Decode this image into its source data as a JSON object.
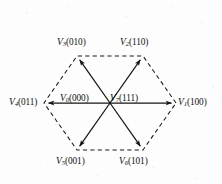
{
  "figure": {
    "shape": "hexagon",
    "edge_style": "dashed",
    "line_color": "#1a1a1a",
    "background_color": "#fdfdfd",
    "center": {
      "x": 110,
      "y": 103
    }
  },
  "vectors": [
    {
      "id": "V1",
      "symbol": "V",
      "subscript": "1",
      "state": "(100)",
      "label": "V1(100)",
      "position": "right",
      "vertex": {
        "x": 176,
        "y": 103
      },
      "label_pos": {
        "left": 178,
        "top": 98
      }
    },
    {
      "id": "V2",
      "symbol": "V",
      "subscript": "2",
      "state": "(110)",
      "label": "V2(110)",
      "position": "top-right",
      "vertex": {
        "x": 143,
        "y": 56
      },
      "label_pos": {
        "left": 120,
        "top": 38
      }
    },
    {
      "id": "V3",
      "symbol": "V",
      "subscript": "3",
      "state": "(010)",
      "label": "V3(010)",
      "position": "top-left",
      "vertex": {
        "x": 77,
        "y": 56
      },
      "label_pos": {
        "left": 57,
        "top": 38
      }
    },
    {
      "id": "V4",
      "symbol": "V",
      "subscript": "4",
      "state": "(011)",
      "label": "V4(011)",
      "position": "left",
      "vertex": {
        "x": 44,
        "y": 103
      },
      "label_pos": {
        "left": 9,
        "top": 98
      }
    },
    {
      "id": "V5",
      "symbol": "V",
      "subscript": "5",
      "state": "(001)",
      "label": "V5(001)",
      "position": "bottom-left",
      "vertex": {
        "x": 77,
        "y": 150
      },
      "label_pos": {
        "left": 56,
        "top": 157
      }
    },
    {
      "id": "V6",
      "symbol": "V",
      "subscript": "6",
      "state": "(101)",
      "label": "V6(101)",
      "position": "bottom-right",
      "vertex": {
        "x": 143,
        "y": 150
      },
      "label_pos": {
        "left": 119,
        "top": 157
      }
    }
  ],
  "zero_vectors": [
    {
      "id": "V0",
      "symbol": "V",
      "subscript": "0",
      "state": "(000)",
      "label": "V0(000)",
      "position": "center-left",
      "label_pos": {
        "left": 60,
        "top": 94
      }
    },
    {
      "id": "V7",
      "symbol": "V",
      "subscript": "7",
      "state": "(111)",
      "label": "V7(111)",
      "position": "center-right",
      "label_pos": {
        "left": 110,
        "top": 94
      }
    }
  ]
}
